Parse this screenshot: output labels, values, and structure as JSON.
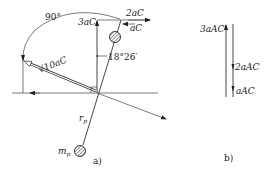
{
  "figure_a": {
    "caption": "a)",
    "angle_arc_label": "90°",
    "angle_small_label": "18°26′",
    "vertical_vector_label": "3aC",
    "top_right_label_1": "2aC",
    "top_right_label_2": "aC",
    "resultant_label": "√10aC",
    "radius_label": "r",
    "radius_sub": "p",
    "mass_label": "m",
    "mass_sub": "p"
  },
  "figure_b": {
    "caption": "b)",
    "top_label": "3aAC",
    "mid_label": "2aAC",
    "bottom_label": "aAC"
  }
}
